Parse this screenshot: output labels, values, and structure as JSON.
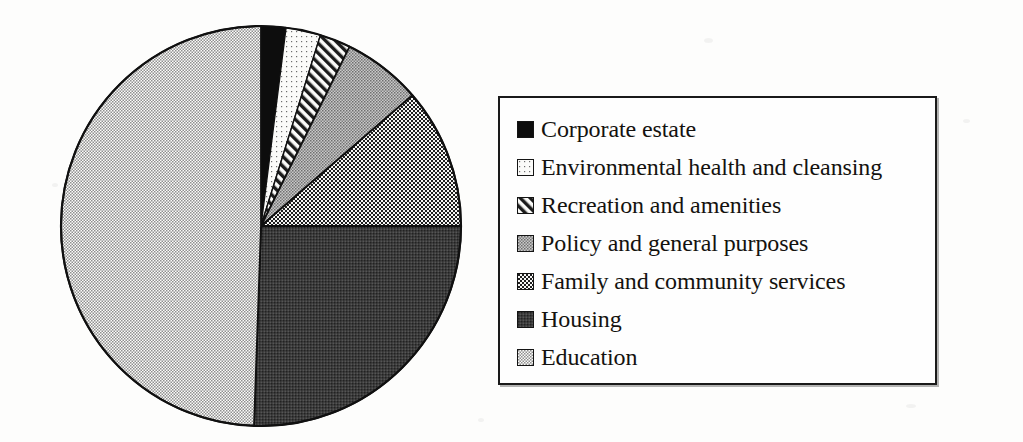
{
  "figure": {
    "name": "pie-chart-figure",
    "background_color": "#fdfdfc",
    "ink_color": "#141414"
  },
  "legend": {
    "name": "legend",
    "border_color": "#1a1a1a",
    "background_color": "#fefefe",
    "items": [
      {
        "label": "Corporate estate",
        "pattern": "solid-black",
        "swatch_name": "swatch-corporate-estate"
      },
      {
        "label": "Environmental health and cleansing",
        "pattern": "sparse-dots",
        "swatch_name": "swatch-environmental-health-and-cleansing"
      },
      {
        "label": "Recreation and amenities",
        "pattern": "diagonal-hatch",
        "swatch_name": "swatch-recreation-and-amenities"
      },
      {
        "label": "Policy and general purposes",
        "pattern": "medium-gray-stipple",
        "swatch_name": "swatch-policy-and-general-purposes"
      },
      {
        "label": "Family and community services",
        "pattern": "checkerboard",
        "swatch_name": "swatch-family-and-community-services"
      },
      {
        "label": "Housing",
        "pattern": "dark-stipple",
        "swatch_name": "swatch-housing"
      },
      {
        "label": "Education",
        "pattern": "fine-checker",
        "swatch_name": "swatch-education"
      }
    ]
  },
  "chart_data": {
    "type": "pie",
    "title": "",
    "subtitle": "",
    "xlabel": "",
    "ylabel": "",
    "grid": false,
    "legend_position": "right",
    "start_angle_deg": 0,
    "direction": "clockwise",
    "center_px": [
      261,
      226
    ],
    "radius_px": 200,
    "categories": [
      "Corporate estate",
      "Environmental health and cleansing",
      "Recreation and amenities",
      "Policy and general purposes",
      "Family and community services",
      "Housing",
      "Education"
    ],
    "values": [
      2.0,
      2.8,
      2.5,
      6.4,
      11.4,
      25.6,
      49.3
    ],
    "unit": "percent",
    "slices": [
      {
        "label": "Corporate estate",
        "percent": 2.0,
        "start_deg": 0.0,
        "end_deg": 7.2,
        "pattern": "solid-black",
        "fill": "#111111"
      },
      {
        "label": "Environmental health and cleansing",
        "percent": 2.8,
        "start_deg": 7.2,
        "end_deg": 17.3,
        "pattern": "sparse-dots",
        "fill": "#f2f2f0"
      },
      {
        "label": "Recreation and amenities",
        "percent": 2.5,
        "start_deg": 17.3,
        "end_deg": 26.3,
        "pattern": "diagonal-hatch",
        "fill": "#dcdcdc"
      },
      {
        "label": "Policy and general purposes",
        "percent": 6.4,
        "start_deg": 26.3,
        "end_deg": 49.2,
        "pattern": "medium-gray-stipple",
        "fill": "#a8a8a8"
      },
      {
        "label": "Family and community services",
        "percent": 11.4,
        "start_deg": 49.2,
        "end_deg": 90.0,
        "pattern": "checkerboard",
        "fill": "#8a8a8a"
      },
      {
        "label": "Housing",
        "percent": 25.6,
        "start_deg": 90.0,
        "end_deg": 182.0,
        "pattern": "dark-stipple",
        "fill": "#4a4a4a"
      },
      {
        "label": "Education",
        "percent": 49.3,
        "start_deg": 182.0,
        "end_deg": 360.0,
        "pattern": "fine-checker",
        "fill": "#d8d8d8"
      }
    ]
  }
}
